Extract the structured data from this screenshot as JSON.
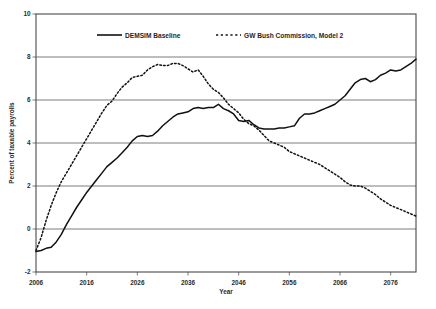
{
  "chart_data": {
    "type": "line",
    "title": "",
    "xlabel": "Year",
    "ylabel": "Percent of taxable payrolls",
    "xlim": [
      2006,
      2081
    ],
    "ylim": [
      -2,
      10
    ],
    "xticks": [
      2006,
      2016,
      2026,
      2036,
      2046,
      2056,
      2066,
      2076
    ],
    "yticks": [
      -2,
      0,
      2,
      4,
      6,
      8,
      10
    ],
    "xtick_labels": [
      "2006",
      "2016",
      "2026",
      "2036",
      "2046",
      "2056",
      "2066",
      "2076"
    ],
    "ytick_labels": [
      "-2",
      "0",
      "2",
      "4",
      "6",
      "8",
      "10"
    ],
    "grid": "horizontal",
    "legend_position": "top-inside",
    "series": [
      {
        "name": "DEMSIM Baseline",
        "style": "solid",
        "color": "#111111",
        "x": [
          2006,
          2007,
          2008,
          2009,
          2010,
          2011,
          2012,
          2013,
          2014,
          2015,
          2016,
          2017,
          2018,
          2019,
          2020,
          2021,
          2022,
          2023,
          2024,
          2025,
          2026,
          2027,
          2028,
          2029,
          2030,
          2031,
          2032,
          2033,
          2034,
          2035,
          2036,
          2037,
          2038,
          2039,
          2040,
          2041,
          2042,
          2043,
          2044,
          2045,
          2046,
          2047,
          2048,
          2049,
          2050,
          2051,
          2052,
          2053,
          2054,
          2055,
          2056,
          2057,
          2058,
          2059,
          2060,
          2061,
          2062,
          2063,
          2064,
          2065,
          2066,
          2067,
          2068,
          2069,
          2070,
          2071,
          2072,
          2073,
          2074,
          2075,
          2076,
          2077,
          2078,
          2079,
          2080,
          2081
        ],
        "values": [
          -1.05,
          -1.0,
          -0.9,
          -0.85,
          -0.6,
          -0.25,
          0.2,
          0.6,
          1.0,
          1.35,
          1.7,
          2.0,
          2.3,
          2.6,
          2.9,
          3.1,
          3.3,
          3.55,
          3.8,
          4.1,
          4.3,
          4.35,
          4.3,
          4.35,
          4.55,
          4.8,
          5.0,
          5.2,
          5.35,
          5.4,
          5.45,
          5.6,
          5.65,
          5.6,
          5.65,
          5.65,
          5.8,
          5.6,
          5.5,
          5.35,
          5.05,
          5.0,
          5.05,
          4.85,
          4.7,
          4.65,
          4.65,
          4.65,
          4.7,
          4.7,
          4.75,
          4.8,
          5.15,
          5.35,
          5.35,
          5.4,
          5.5,
          5.6,
          5.7,
          5.8,
          6.0,
          6.2,
          6.5,
          6.8,
          6.95,
          7.0,
          6.85,
          6.95,
          7.15,
          7.25,
          7.4,
          7.35,
          7.4,
          7.55,
          7.7,
          7.9
        ]
      },
      {
        "name": "GW Bush Commission, Model 2",
        "style": "dashed",
        "color": "#111111",
        "x": [
          2006,
          2007,
          2008,
          2009,
          2010,
          2011,
          2012,
          2013,
          2014,
          2015,
          2016,
          2017,
          2018,
          2019,
          2020,
          2021,
          2022,
          2023,
          2024,
          2025,
          2026,
          2027,
          2028,
          2029,
          2030,
          2031,
          2032,
          2033,
          2034,
          2035,
          2036,
          2037,
          2038,
          2039,
          2040,
          2041,
          2042,
          2043,
          2044,
          2045,
          2046,
          2047,
          2048,
          2049,
          2050,
          2051,
          2052,
          2053,
          2054,
          2055,
          2056,
          2057,
          2058,
          2059,
          2060,
          2061,
          2062,
          2063,
          2064,
          2065,
          2066,
          2067,
          2068,
          2069,
          2070,
          2071,
          2072,
          2073,
          2074,
          2075,
          2076,
          2077,
          2078,
          2079,
          2080,
          2081
        ],
        "values": [
          -1.0,
          -0.4,
          0.4,
          1.1,
          1.7,
          2.2,
          2.6,
          3.0,
          3.4,
          3.8,
          4.2,
          4.6,
          5.0,
          5.4,
          5.75,
          5.95,
          6.3,
          6.6,
          6.8,
          7.05,
          7.1,
          7.15,
          7.4,
          7.55,
          7.65,
          7.6,
          7.6,
          7.7,
          7.7,
          7.6,
          7.45,
          7.3,
          7.4,
          7.1,
          6.75,
          6.5,
          6.35,
          6.1,
          5.8,
          5.6,
          5.4,
          5.1,
          4.9,
          4.8,
          4.6,
          4.35,
          4.1,
          4.0,
          3.9,
          3.8,
          3.6,
          3.5,
          3.4,
          3.3,
          3.2,
          3.1,
          3.0,
          2.85,
          2.7,
          2.55,
          2.4,
          2.2,
          2.05,
          2.0,
          2.0,
          1.9,
          1.75,
          1.6,
          1.4,
          1.25,
          1.1,
          1.0,
          0.9,
          0.8,
          0.7,
          0.6
        ]
      }
    ]
  },
  "legend": {
    "entries": [
      {
        "label": "DEMSIM Baseline",
        "style": "solid"
      },
      {
        "label": "GW Bush Commission, Model 2",
        "style": "dashed"
      }
    ]
  },
  "axes": {
    "x_title": "Year",
    "y_title": "Percent of taxable payrolls"
  }
}
